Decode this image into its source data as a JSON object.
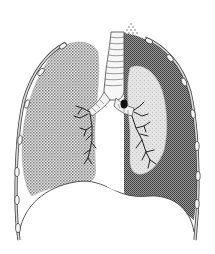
{
  "figure": {
    "width": 215,
    "height": 254,
    "colors": {
      "background": "#ffffff",
      "outline": "#333333",
      "lung_light_dots": "#8a8a8a",
      "pleural_dark_dots": "#555555",
      "collapsed_lung_fill": "#dcdcdc",
      "rib_fill": "#f2f2f2",
      "trachea_fill": "#f7f7f7"
    },
    "parts": [
      {
        "name": "trachea"
      },
      {
        "name": "left-lung-normal"
      },
      {
        "name": "right-lung-collapsed"
      },
      {
        "name": "pleural-space-air"
      },
      {
        "name": "ribcage-left"
      },
      {
        "name": "ribcage-right"
      },
      {
        "name": "diaphragm"
      },
      {
        "name": "bronchial-tree-left"
      },
      {
        "name": "bronchial-tree-right"
      }
    ]
  }
}
